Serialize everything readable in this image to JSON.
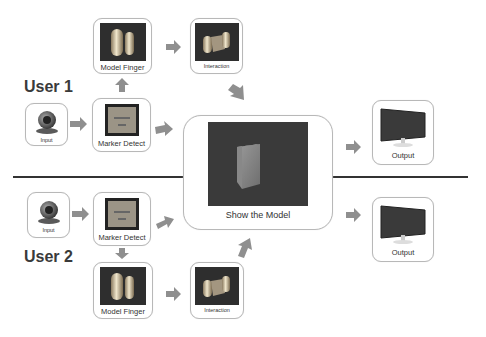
{
  "users": [
    {
      "label": "User 1",
      "input": {
        "label": "Input",
        "icon": "webcam-icon"
      },
      "marker_detect": {
        "label": "Marker Detect",
        "icon": "marker-icon"
      },
      "model_finger": {
        "label": "Model Finger",
        "icon": "finger-model-icon"
      },
      "interaction": {
        "label": "Interaction",
        "icon": "interaction-icon"
      },
      "output": {
        "label": "Output",
        "icon": "monitor-icon"
      }
    },
    {
      "label": "User 2",
      "input": {
        "label": "Input",
        "icon": "webcam-icon"
      },
      "marker_detect": {
        "label": "Marker Detect",
        "icon": "marker-icon"
      },
      "model_finger": {
        "label": "Model Finger",
        "icon": "finger-model-icon"
      },
      "interaction": {
        "label": "Interaction",
        "icon": "interaction-icon"
      },
      "output": {
        "label": "Output",
        "icon": "monitor-icon"
      }
    }
  ],
  "center": {
    "label": "Show the Model",
    "icon": "cube-icon"
  },
  "colors": {
    "arrow": "#8f8f8f",
    "thumb_bg": "#2e2e2e",
    "box_border": "#b8b8b8",
    "divider": "#333333"
  }
}
